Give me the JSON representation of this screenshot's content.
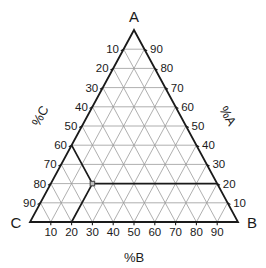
{
  "chart_data": {
    "type": "scatter",
    "plot_kind": "ternary-diagram",
    "title": "",
    "vertices": [
      {
        "id": "A",
        "label": "A",
        "position": "top"
      },
      {
        "id": "B",
        "label": "B",
        "position": "bottom-right"
      },
      {
        "id": "C",
        "label": "C",
        "position": "bottom-left"
      }
    ],
    "axes": [
      {
        "id": "A",
        "title": "%A",
        "side": "right",
        "ticks": [
          10,
          20,
          30,
          40,
          50,
          60,
          70,
          80,
          90
        ],
        "tick_labels": [
          "10",
          "20",
          "30",
          "40",
          "50",
          "60",
          "70",
          "80",
          "90"
        ],
        "range": [
          0,
          100
        ],
        "direction": "increases-toward-A"
      },
      {
        "id": "B",
        "title": "%B",
        "side": "bottom",
        "ticks": [
          10,
          20,
          30,
          40,
          50,
          60,
          70,
          80,
          90
        ],
        "tick_labels": [
          "10",
          "20",
          "30",
          "40",
          "50",
          "60",
          "70",
          "80",
          "90"
        ],
        "range": [
          0,
          100
        ],
        "direction": "increases-toward-B"
      },
      {
        "id": "C",
        "title": "%C",
        "side": "left",
        "ticks": [
          10,
          20,
          30,
          40,
          50,
          60,
          70,
          80,
          90
        ],
        "tick_labels": [
          "10",
          "20",
          "30",
          "40",
          "50",
          "60",
          "70",
          "80",
          "90"
        ],
        "range": [
          0,
          100
        ],
        "direction": "increases-toward-C"
      }
    ],
    "grid": {
      "on": true,
      "interval": 10,
      "color": "#9a9a9a"
    },
    "legend": {
      "on": false
    },
    "points": [
      {
        "name": "sample-point",
        "A": 20,
        "B": 20,
        "C": 60,
        "marker": "square"
      }
    ],
    "construction_lines": [
      {
        "axis": "A",
        "value": 20,
        "from_vertex_opposite": "A",
        "style": "bold"
      },
      {
        "axis": "B",
        "value": 20,
        "from_vertex_opposite": "B",
        "style": "bold"
      },
      {
        "axis": "C",
        "value": 60,
        "from_vertex_opposite": "C",
        "style": "bold"
      }
    ],
    "colors": {
      "outline": "#1a1a1a",
      "grid": "#9a9a9a",
      "bold_line": "#1a1a1a",
      "marker": "#555555",
      "background": "#ffffff"
    }
  },
  "labels": {
    "vertex_a": "A",
    "vertex_b": "B",
    "vertex_c": "C",
    "axis_a": "%A",
    "axis_b": "%B",
    "axis_c": "%C",
    "ticks_a": [
      "90",
      "80",
      "70",
      "60",
      "50",
      "40",
      "30",
      "20",
      "10"
    ],
    "ticks_b": [
      "10",
      "20",
      "30",
      "40",
      "50",
      "60",
      "70",
      "80",
      "90"
    ],
    "ticks_c": [
      "10",
      "20",
      "30",
      "40",
      "50",
      "60",
      "70",
      "80",
      "90"
    ]
  }
}
